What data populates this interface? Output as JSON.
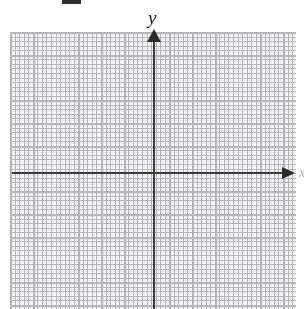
{
  "figure": {
    "title": "",
    "type": "blank-cartesian-coordinate-plane"
  },
  "axes": {
    "y_label": "y",
    "x_label": "x",
    "x_axis_name": "horizontal-axis",
    "y_axis_name": "vertical-axis"
  },
  "icons": {
    "y_arrow": "arrow-up-icon",
    "x_arrow": "arrow-right-icon"
  },
  "colors": {
    "axis": "#3a3a3a",
    "arrow": "#2b2b2b",
    "major_grid": "#b8b8be",
    "minor_grid": "#d8d8dc",
    "background": "#ffffff",
    "label": "#1c1c1c"
  },
  "chart_data": {
    "type": "scatter",
    "title": "",
    "xlabel": "x",
    "ylabel": "y",
    "x": [],
    "y": [],
    "series": [],
    "xlim": [
      -7,
      6
    ],
    "ylim": [
      -6,
      6
    ],
    "grid": true,
    "major_gridline_spacing": 1,
    "minor_gridlines_per_major": 5,
    "legend": "none",
    "tick_labels": [],
    "annotations": []
  },
  "artifacts": {
    "top_crop_bar": "cropped-text-fragment"
  }
}
